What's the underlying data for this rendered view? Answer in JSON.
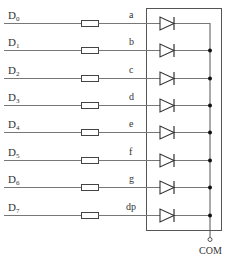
{
  "diagram": {
    "title": "",
    "inputs": [
      {
        "name": "D",
        "sub": "0",
        "segment": "a"
      },
      {
        "name": "D",
        "sub": "1",
        "segment": "b"
      },
      {
        "name": "D",
        "sub": "2",
        "segment": "c"
      },
      {
        "name": "D",
        "sub": "3",
        "segment": "d"
      },
      {
        "name": "D",
        "sub": "4",
        "segment": "e"
      },
      {
        "name": "D",
        "sub": "5",
        "segment": "f"
      },
      {
        "name": "D",
        "sub": "6",
        "segment": "g"
      },
      {
        "name": "D",
        "sub": "7",
        "segment": "dp"
      }
    ],
    "common_label": "COM",
    "components": {
      "resistor": "resistor-symbol",
      "diode": "led-diode-symbol",
      "package": "seven-segment-display-common-cathode"
    },
    "colors": {
      "line": "#777777",
      "symbol": "#333333",
      "background": "#ffffff"
    }
  }
}
